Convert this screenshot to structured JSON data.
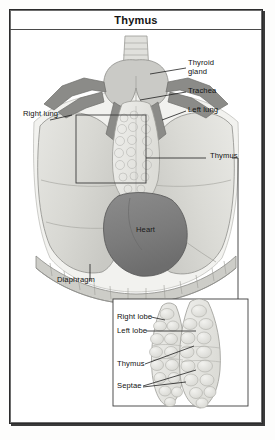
{
  "figure": {
    "title": "Thymus",
    "type": "anatomical-illustration"
  },
  "main_view": {
    "name": "thoracic-overview",
    "labels": [
      {
        "id": "thyroid-gland",
        "text": "Thyroid\ngland",
        "side": "right",
        "x": 178,
        "y": 54
      },
      {
        "id": "trachea",
        "text": "Trachea",
        "side": "right",
        "x": 178,
        "y": 80
      },
      {
        "id": "left-lung",
        "text": "Left lung",
        "side": "right",
        "x": 178,
        "y": 100
      },
      {
        "id": "right-lung",
        "text": "Right lung",
        "side": "left",
        "x": 12,
        "y": 100
      },
      {
        "id": "thymus-main",
        "text": "Thymus",
        "side": "right",
        "x": 200,
        "y": 141
      },
      {
        "id": "heart",
        "text": "Heart",
        "side": "inside",
        "x": 127,
        "y": 212
      },
      {
        "id": "diaphragm",
        "text": "Diaphragm",
        "side": "below",
        "x": 49,
        "y": 250
      }
    ],
    "magnification_box": {
      "x": 66,
      "y": 105,
      "width": 70,
      "height": 68
    }
  },
  "inset_view": {
    "name": "thymus-detail",
    "box": {
      "x": 103,
      "y": 289,
      "width": 135,
      "height": 107
    },
    "labels": [
      {
        "id": "right-lobe",
        "text": "Right lobe",
        "x": 107,
        "y": 306
      },
      {
        "id": "left-lobe",
        "text": "Left lobe",
        "x": 107,
        "y": 320
      },
      {
        "id": "thymus-inset",
        "text": "Thymus",
        "x": 107,
        "y": 353
      },
      {
        "id": "septae",
        "text": "Septae",
        "x": 107,
        "y": 375
      }
    ]
  },
  "palette": {
    "frame_border": "#2b2b2b",
    "lung_fill": "#dcdcd8",
    "lung_stroke": "#8e8e8a",
    "heart_fill": "#7d7d7d",
    "heart_stroke": "#4f4f4f",
    "vessel_fill": "#8a8a88",
    "thyroid_fill": "#c6c6c2",
    "thymus_fill": "#e4e4e0",
    "diaphragm_fill": "#c9c9c4",
    "label_text": "#111111",
    "leader_line": "#1f1f1f",
    "background": "#ffffff"
  }
}
